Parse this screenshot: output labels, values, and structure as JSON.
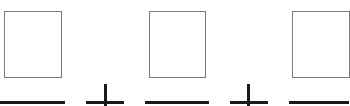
{
  "worksheet": {
    "expression": "□ + □ + □",
    "colors": {
      "box_border": "#7a7a7a",
      "stroke": "#1a1a1a",
      "background": "#ffffff"
    },
    "terms": [
      {
        "box": {
          "x": 4,
          "y": 11,
          "w": 58,
          "h": 67
        },
        "blank": {
          "x": 0,
          "y": 101,
          "w": 65
        }
      },
      {
        "box": {
          "x": 149,
          "y": 11,
          "w": 57,
          "h": 67
        },
        "blank": {
          "x": 145,
          "y": 101,
          "w": 64
        }
      },
      {
        "box": {
          "x": 292,
          "y": 11,
          "w": 58,
          "h": 67
        },
        "blank": {
          "x": 289,
          "y": 101,
          "w": 60
        }
      }
    ],
    "operators": [
      {
        "symbol": "+",
        "name": "plus",
        "cx": 105,
        "h_from": 86,
        "h_to": 124,
        "h_y": 101,
        "v_from": 84,
        "v_to": 106
      },
      {
        "symbol": "+",
        "name": "plus",
        "cx": 248,
        "h_from": 230,
        "h_to": 268,
        "h_y": 101,
        "v_from": 84,
        "v_to": 106
      }
    ]
  }
}
